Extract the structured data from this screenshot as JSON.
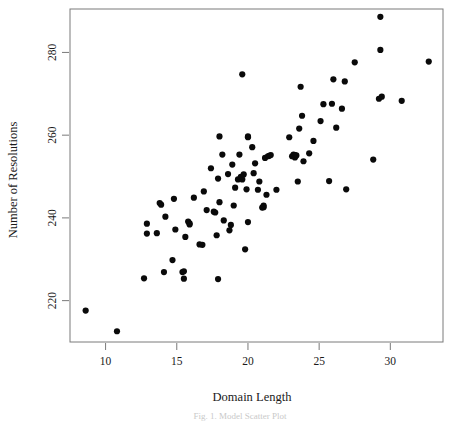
{
  "figure": {
    "type": "scatter-plot",
    "background_color": "#ffffff",
    "point_color": "#0a0a0a",
    "axis_color": "#7a7a7a",
    "caption_text": "Fig. 1. Model Scatter Plot"
  },
  "chart_data": {
    "type": "scatter",
    "title": "",
    "subtitle": "",
    "xlabel": "Domain Length",
    "ylabel": "Number of Resolutions",
    "xlim": [
      7.5,
      33.7
    ],
    "ylim": [
      210.0,
      290.5
    ],
    "xticks": [
      10,
      15,
      20,
      25,
      30
    ],
    "xtick_labels": [
      "10",
      "15",
      "20",
      "25",
      "30"
    ],
    "yticks": [
      220,
      240,
      260,
      280
    ],
    "ytick_labels": [
      "220",
      "240",
      "260",
      "280"
    ],
    "grid": false,
    "legend": null,
    "legend_position": "none",
    "marker": "filled-circle",
    "marker_size_px": 3.1,
    "n_points": 104,
    "points": [
      [
        8.6,
        217.6
      ],
      [
        10.8,
        212.6
      ],
      [
        12.7,
        225.4
      ],
      [
        12.9,
        238.6
      ],
      [
        12.9,
        236.2
      ],
      [
        13.6,
        236.3
      ],
      [
        13.8,
        243.6
      ],
      [
        13.9,
        243.2
      ],
      [
        14.1,
        226.9
      ],
      [
        14.2,
        240.3
      ],
      [
        14.7,
        229.8
      ],
      [
        14.8,
        244.6
      ],
      [
        14.9,
        237.2
      ],
      [
        15.4,
        226.9
      ],
      [
        15.5,
        227.1
      ],
      [
        15.5,
        225.3
      ],
      [
        15.6,
        235.4
      ],
      [
        15.8,
        239.1
      ],
      [
        15.9,
        238.4
      ],
      [
        15.9,
        238.7
      ],
      [
        16.2,
        244.9
      ],
      [
        16.6,
        233.6
      ],
      [
        16.8,
        233.5
      ],
      [
        16.9,
        246.4
      ],
      [
        17.1,
        241.9
      ],
      [
        17.4,
        252.0
      ],
      [
        17.6,
        241.5
      ],
      [
        17.7,
        241.3
      ],
      [
        17.8,
        235.8
      ],
      [
        17.9,
        249.5
      ],
      [
        17.9,
        225.2
      ],
      [
        18.0,
        259.7
      ],
      [
        18.0,
        243.8
      ],
      [
        18.2,
        255.3
      ],
      [
        18.3,
        239.4
      ],
      [
        18.6,
        250.6
      ],
      [
        18.7,
        237.0
      ],
      [
        18.8,
        238.3
      ],
      [
        18.9,
        252.9
      ],
      [
        19.0,
        243.0
      ],
      [
        19.1,
        247.3
      ],
      [
        19.3,
        249.3
      ],
      [
        19.4,
        255.3
      ],
      [
        19.5,
        249.6
      ],
      [
        19.5,
        249.9
      ],
      [
        19.6,
        274.7
      ],
      [
        19.6,
        249.3
      ],
      [
        19.7,
        250.5
      ],
      [
        19.8,
        232.4
      ],
      [
        19.9,
        246.9
      ],
      [
        20.0,
        259.5
      ],
      [
        20.0,
        259.7
      ],
      [
        20.0,
        239.0
      ],
      [
        20.3,
        257.1
      ],
      [
        20.4,
        250.8
      ],
      [
        20.5,
        253.2
      ],
      [
        20.7,
        246.8
      ],
      [
        20.8,
        248.8
      ],
      [
        21.0,
        242.5
      ],
      [
        21.1,
        242.6
      ],
      [
        21.1,
        243.0
      ],
      [
        21.2,
        254.5
      ],
      [
        21.3,
        245.6
      ],
      [
        21.4,
        254.9
      ],
      [
        21.5,
        255.0
      ],
      [
        21.6,
        255.2
      ],
      [
        22.0,
        246.8
      ],
      [
        22.9,
        259.5
      ],
      [
        23.1,
        254.9
      ],
      [
        23.2,
        255.0
      ],
      [
        23.2,
        255.3
      ],
      [
        23.3,
        255.2
      ],
      [
        23.3,
        254.6
      ],
      [
        23.4,
        255.1
      ],
      [
        23.5,
        248.8
      ],
      [
        23.6,
        261.6
      ],
      [
        23.7,
        271.7
      ],
      [
        23.8,
        264.7
      ],
      [
        23.9,
        253.7
      ],
      [
        24.3,
        255.6
      ],
      [
        24.6,
        258.6
      ],
      [
        25.1,
        263.4
      ],
      [
        25.3,
        267.5
      ],
      [
        25.7,
        248.9
      ],
      [
        25.9,
        267.6
      ],
      [
        26.0,
        273.5
      ],
      [
        26.2,
        261.8
      ],
      [
        26.6,
        266.4
      ],
      [
        26.8,
        273.0
      ],
      [
        26.9,
        246.9
      ],
      [
        27.5,
        277.6
      ],
      [
        28.8,
        254.1
      ],
      [
        29.2,
        268.8
      ],
      [
        29.3,
        288.6
      ],
      [
        29.3,
        280.6
      ],
      [
        29.4,
        269.3
      ],
      [
        30.8,
        268.3
      ],
      [
        32.7,
        277.8
      ]
    ]
  }
}
